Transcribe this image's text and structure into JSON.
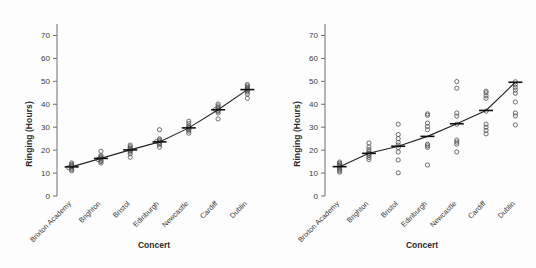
{
  "figure": {
    "background": "#fdfdfd",
    "marker_color": "#555555",
    "line_color": "#232323",
    "axis_color": "#6f6f6f"
  },
  "chart_data": [
    {
      "type": "scatter",
      "panel": "left",
      "title": "",
      "xlabel": "Concert",
      "ylabel": "Ringing (Hours)",
      "ylim": [
        0,
        75
      ],
      "yticks": [
        0,
        10,
        20,
        30,
        40,
        50,
        60,
        70
      ],
      "ytick_labels": [
        "0",
        "10",
        "20",
        "30",
        "40",
        "50",
        "60",
        "70"
      ],
      "grid": false,
      "legend": "none",
      "categories": [
        "Brixton Academy",
        "Brighton",
        "Bristol",
        "Edinburgh",
        "Newcastle",
        "Cardiff",
        "Dublin"
      ],
      "means": [
        12.7,
        16.4,
        20.1,
        23.6,
        29.7,
        37.6,
        46.4
      ],
      "mean_marker": "horizontal-bar",
      "series": [
        {
          "name": "Brixton Academy",
          "values": [
            11.0,
            11.6,
            12.1,
            12.4,
            12.7,
            13.0,
            13.3,
            13.8,
            14.4
          ]
        },
        {
          "name": "Brighton",
          "values": [
            14.4,
            15.0,
            15.5,
            15.9,
            16.3,
            16.7,
            17.1,
            17.6,
            19.5
          ]
        },
        {
          "name": "Bristol",
          "values": [
            16.9,
            18.4,
            19.2,
            19.7,
            20.1,
            20.5,
            20.9,
            21.5,
            22.2
          ]
        },
        {
          "name": "Edinburgh",
          "values": [
            21.3,
            22.4,
            23.0,
            23.4,
            23.7,
            24.0,
            24.4,
            24.9,
            28.9
          ]
        },
        {
          "name": "Newcastle",
          "values": [
            27.4,
            28.3,
            28.9,
            29.3,
            29.7,
            30.1,
            30.6,
            31.6,
            32.6
          ]
        },
        {
          "name": "Cardiff",
          "values": [
            33.6,
            36.2,
            36.9,
            37.3,
            37.7,
            38.1,
            38.6,
            39.3,
            40.1
          ]
        },
        {
          "name": "Dublin",
          "values": [
            42.6,
            44.4,
            45.3,
            45.9,
            46.4,
            46.9,
            47.4,
            48.0,
            48.6
          ]
        }
      ]
    },
    {
      "type": "scatter",
      "panel": "right",
      "title": "",
      "xlabel": "Concert",
      "ylabel": "Ringing (Hours)",
      "ylim": [
        0,
        75
      ],
      "yticks": [
        0,
        10,
        20,
        30,
        40,
        50,
        60,
        70
      ],
      "ytick_labels": [
        "0",
        "10",
        "20",
        "30",
        "40",
        "50",
        "60",
        "70"
      ],
      "grid": false,
      "legend": "none",
      "categories": [
        "Brixton Academy",
        "Brighton",
        "Bristol",
        "Edinburgh",
        "Newcastle",
        "Cardiff",
        "Dublin"
      ],
      "means": [
        12.8,
        18.6,
        21.7,
        26.0,
        31.5,
        37.3,
        49.6
      ],
      "mean_marker": "horizontal-bar",
      "series": [
        {
          "name": "Brixton Academy",
          "values": [
            10.4,
            11.0,
            11.6,
            12.2,
            12.8,
            13.2,
            13.7,
            14.2,
            14.8
          ]
        },
        {
          "name": "Brighton",
          "values": [
            15.9,
            16.8,
            17.6,
            18.2,
            18.7,
            19.4,
            20.2,
            21.4,
            23.1
          ]
        },
        {
          "name": "Bristol",
          "values": [
            10.1,
            15.7,
            19.2,
            21.1,
            22.2,
            23.4,
            25.0,
            26.8,
            31.3
          ]
        },
        {
          "name": "Edinburgh",
          "values": [
            13.5,
            21.2,
            21.9,
            22.6,
            28.9,
            30.3,
            31.8,
            35.2,
            35.8
          ]
        },
        {
          "name": "Newcastle",
          "values": [
            19.2,
            22.6,
            23.5,
            24.4,
            31.3,
            34.8,
            36.2,
            47.0,
            49.9
          ]
        },
        {
          "name": "Cardiff",
          "values": [
            27.1,
            28.6,
            30.0,
            31.3,
            37.0,
            42.6,
            43.7,
            45.0,
            45.7
          ]
        },
        {
          "name": "Dublin",
          "values": [
            31.0,
            34.9,
            36.2,
            41.0,
            44.8,
            46.2,
            47.4,
            48.6,
            49.8
          ]
        }
      ]
    }
  ]
}
